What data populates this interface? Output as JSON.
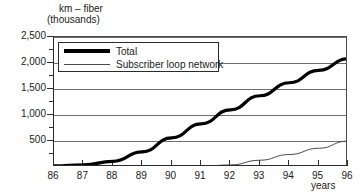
{
  "chart_data": {
    "type": "line",
    "title": "km – fiber (thousands)",
    "title_line1": "km – fiber",
    "title_line2": "(thousands)",
    "xlabel": "years",
    "ylabel": "km – fiber (thousands)",
    "xlim": [
      86,
      96
    ],
    "ylim": [
      0,
      2500
    ],
    "grid": true,
    "legend_position": "top-left",
    "x": [
      86,
      87,
      88,
      89,
      90,
      91,
      92,
      93,
      94,
      95,
      96
    ],
    "xtick_labels": [
      "86",
      "87",
      "88",
      "89",
      "90",
      "91",
      "92",
      "93",
      "94",
      "95",
      "96"
    ],
    "ytick_labels": [
      "2,500",
      "2,000",
      "1,500",
      "1,000",
      "500"
    ],
    "ytick_values": [
      2500,
      2000,
      1500,
      1000,
      500
    ],
    "yminor_values": [
      2250,
      1750,
      1250,
      750,
      250
    ],
    "series": [
      {
        "name": "Total",
        "style": "thick",
        "color": "#000000",
        "values": [
          20,
          40,
          110,
          290,
          560,
          830,
          1100,
          1370,
          1620,
          1860,
          2080
        ]
      },
      {
        "name": "Subscriber loop network",
        "style": "thin",
        "color": "#4a4a4a",
        "values": [
          0,
          0,
          0,
          0,
          0,
          10,
          40,
          130,
          240,
          360,
          500
        ]
      }
    ]
  },
  "legend": {
    "entries": [
      {
        "label": "Total"
      },
      {
        "label": "Subscriber loop network"
      }
    ]
  },
  "colors": {
    "total_line": "#000000",
    "subscriber_line": "#4a4a4a",
    "grid": "#6e6e6e",
    "axis": "#2b2b2b",
    "background": "#ffffff"
  }
}
